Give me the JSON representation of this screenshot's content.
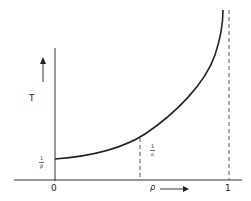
{
  "diagram": {
    "y_axis_label": "T",
    "x_axis_label": "ρ",
    "x_tick_origin": "0",
    "x_tick_end": "1",
    "y_intercept_label": {
      "numerator": "1",
      "denominator": "β"
    },
    "marker_label": {
      "numerator": "1",
      "denominator": "α"
    },
    "colors": {
      "line": "#222222",
      "dashed": "#555555",
      "background": "#ffffff"
    },
    "curve_description": "T increases monotonically from 1/β at ρ=0, asymptotic to ρ=1",
    "dashed_lines": [
      "at ρ marked 1/α",
      "vertical asymptote at ρ = 1"
    ]
  }
}
